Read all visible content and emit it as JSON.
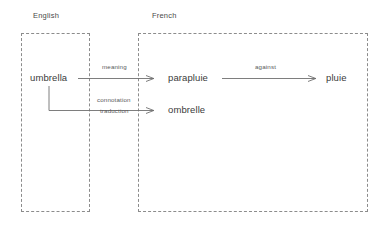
{
  "diagram": {
    "type": "semantic-translation-diagram",
    "background_color": "#ffffff",
    "line_color": "#6f6f6f",
    "box_border_color": "#8c8c8c",
    "text_color": "#3a3a3a",
    "groups": [
      {
        "id": "english",
        "label": "English"
      },
      {
        "id": "french",
        "label": "French"
      }
    ],
    "nodes": [
      {
        "id": "umbrella",
        "label": "umbrella",
        "group": "english"
      },
      {
        "id": "parapluie",
        "label": "parapluie",
        "group": "french"
      },
      {
        "id": "ombrelle",
        "label": "ombrelle",
        "group": "french"
      },
      {
        "id": "pluie",
        "label": "pluie",
        "group": "french"
      }
    ],
    "edges": [
      {
        "id": "edge-meaning",
        "from": "umbrella",
        "to": "parapluie",
        "label": "meaning"
      },
      {
        "id": "edge-connotation",
        "from": "umbrella",
        "to": "ombrelle",
        "label": "connotation"
      },
      {
        "id": "edge-traduction",
        "from": "umbrella",
        "to": "ombrelle",
        "label": "traduction"
      },
      {
        "id": "edge-against",
        "from": "parapluie",
        "to": "pluie",
        "label": "against"
      }
    ]
  }
}
